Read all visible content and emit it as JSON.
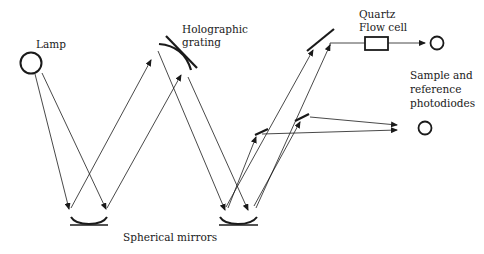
{
  "diagram": {
    "type": "optical-path-schematic",
    "colors": {
      "line": "#1a1a1a",
      "background": "#ffffff"
    },
    "labels": {
      "lamp": "Lamp",
      "grating_line1": "Holographic",
      "grating_line2": "grating",
      "flowcell_line1": "Quartz",
      "flowcell_line2": "Flow cell",
      "photodiodes_line1": "Sample and",
      "photodiodes_line2": "reference",
      "photodiodes_line3": "photodiodes",
      "mirrors": "Spherical mirrors"
    },
    "components": [
      {
        "id": "lamp",
        "shape": "circle",
        "cx": 31,
        "cy": 63,
        "r": 11
      },
      {
        "id": "holographic-grating",
        "shape": "curved-line"
      },
      {
        "id": "spherical-mirror-left",
        "shape": "concave-mirror",
        "x1": 70,
        "x2": 108,
        "y": 224
      },
      {
        "id": "spherical-mirror-right",
        "shape": "concave-mirror",
        "x1": 219,
        "x2": 258,
        "y": 224
      },
      {
        "id": "beam-splitter-upper",
        "shape": "flat-mirror",
        "x1": 307,
        "y1": 51,
        "x2": 334,
        "y2": 29
      },
      {
        "id": "beam-splitter-lower-a",
        "shape": "flat-mirror",
        "x1": 255,
        "y1": 135,
        "x2": 268,
        "y2": 129
      },
      {
        "id": "beam-splitter-lower-b",
        "shape": "flat-mirror",
        "x1": 295,
        "y1": 121,
        "x2": 309,
        "y2": 114
      },
      {
        "id": "quartz-flow-cell",
        "shape": "rect",
        "x": 365,
        "y": 37,
        "w": 23,
        "h": 13
      },
      {
        "id": "sample-photodiode",
        "shape": "circle",
        "cx": 437,
        "cy": 43,
        "r": 7
      },
      {
        "id": "reference-photodiode",
        "shape": "circle",
        "cx": 425,
        "cy": 128,
        "r": 7
      }
    ]
  }
}
